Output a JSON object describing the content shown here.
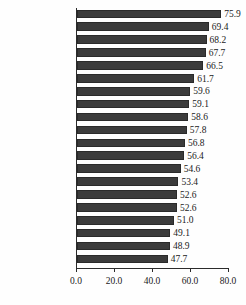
{
  "chart_data": {
    "type": "bar",
    "orientation": "horizontal",
    "title": "",
    "xlabel": "",
    "ylabel": "",
    "xlim": [
      0.0,
      80.0
    ],
    "xticks": [
      "0.0",
      "20.0",
      "40.0",
      "60.0",
      "80.0"
    ],
    "xtick_values": [
      0.0,
      20.0,
      40.0,
      60.0,
      80.0
    ],
    "grid": false,
    "legend": false,
    "bar_color": "#3b3b3b",
    "axis_color": "#2b2b2b",
    "categories": [
      "Portugal",
      "Switzerland",
      "Japan",
      "Norway",
      "Sweden",
      "Denmark",
      "NZ",
      "Australia",
      "Finland",
      "US",
      "NL",
      "France",
      "Canada",
      "Ireland",
      "UK",
      "Austria",
      "Spain",
      "Belgium",
      "Germany",
      "Italy"
    ],
    "values": [
      75.9,
      69.4,
      68.2,
      67.7,
      66.5,
      61.7,
      59.6,
      59.1,
      58.6,
      57.8,
      56.8,
      56.4,
      54.6,
      53.4,
      52.6,
      52.6,
      51.0,
      49.1,
      48.9,
      47.7
    ],
    "value_labels": [
      "75.9",
      "69.4",
      "68.2",
      "67.7",
      "66.5",
      "61.7",
      "59.6",
      "59.1",
      "58.6",
      "57.8",
      "56.8",
      "56.4",
      "54.6",
      "53.4",
      "52.6",
      "52.6",
      "51.0",
      "49.1",
      "48.9",
      "47.7"
    ]
  }
}
